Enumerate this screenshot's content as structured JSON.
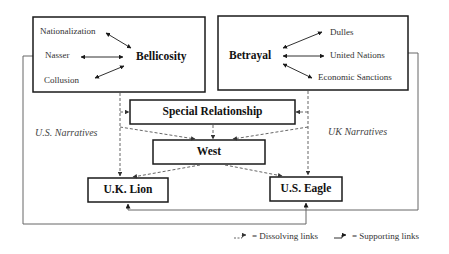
{
  "diagram": {
    "left_group": {
      "central_node": "Bellicosity",
      "linked_terms": [
        "Nationalization",
        "Nasser",
        "Collusion"
      ]
    },
    "right_group": {
      "central_node": "Betrayal",
      "linked_terms": [
        "Dulles",
        "United Nations",
        "Economic Sanctions"
      ]
    },
    "nodes": {
      "special_relationship": "Special Relationship",
      "west": "West",
      "uk_lion": "U.K. Lion",
      "us_eagle": "U.S. Eagle"
    },
    "side_labels": {
      "left": "U.S. Narratives",
      "right": "UK Narratives"
    },
    "legend": {
      "dissolving": "= Dissolving links",
      "supporting": "= Supporting links"
    },
    "colors": {
      "line": "#1a1a1a",
      "dashed": "#555555",
      "outer_line": "#666666"
    }
  }
}
